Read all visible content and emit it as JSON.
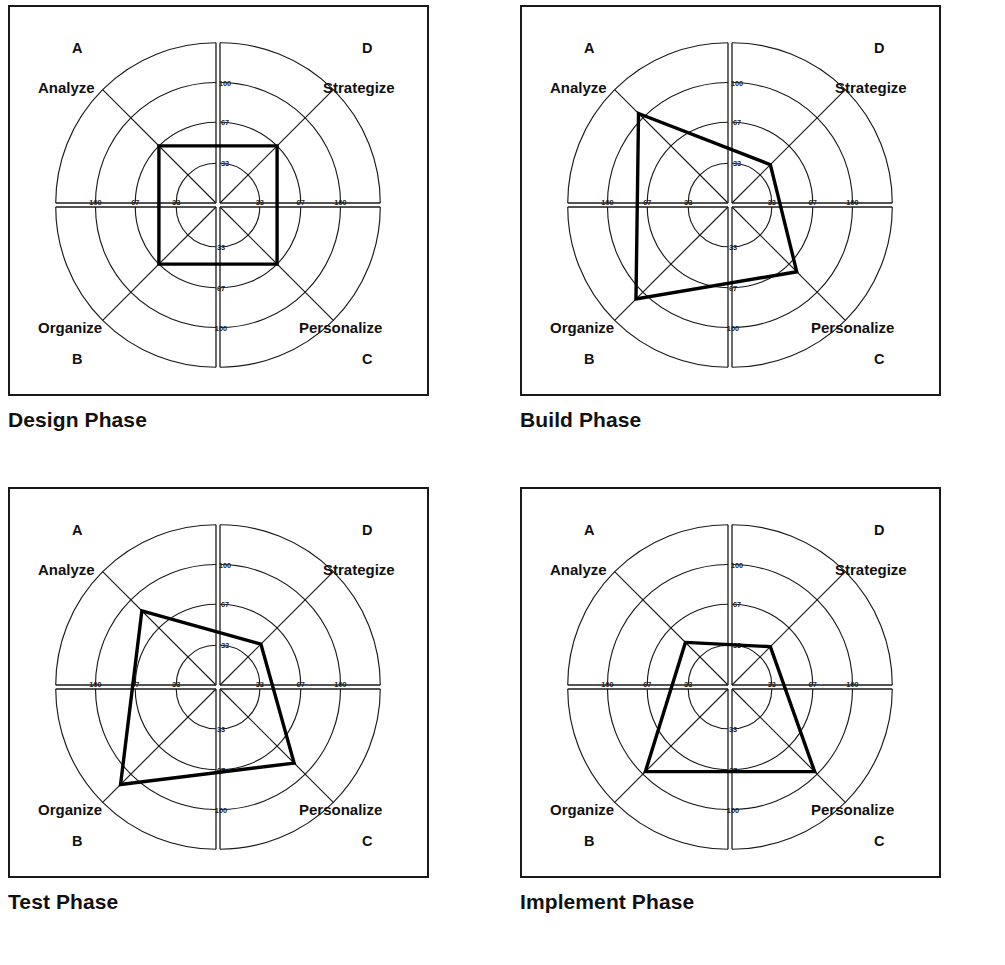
{
  "page": {
    "background_color": "#ffffff",
    "line_color": "#1a1a1a",
    "profile_color": "#000000"
  },
  "quadrants": {
    "A": {
      "letter": "A",
      "label": "Analyze",
      "position": "upper-left"
    },
    "D": {
      "letter": "D",
      "label": "Strategize",
      "position": "upper-right"
    },
    "B": {
      "letter": "B",
      "label": "Organize",
      "position": "lower-left"
    },
    "C": {
      "letter": "C",
      "label": "Personalize",
      "position": "lower-right"
    }
  },
  "scale": {
    "ticks": [
      33,
      67,
      100
    ],
    "tick_labels": [
      "33",
      "67",
      "100"
    ],
    "horizontal_left": [
      "100",
      "67",
      "33"
    ],
    "horizontal_right": [
      "33",
      "67",
      "100"
    ],
    "vertical_top": [
      "100",
      "67",
      "33"
    ],
    "vertical_bottom": [
      "33",
      "67",
      "100"
    ],
    "max": 133,
    "min": 0
  },
  "charts": [
    {
      "id": "design",
      "title": "Design Phase",
      "quadrant_values": {
        "A": 67,
        "D": 67,
        "C": 67,
        "B": 67
      },
      "shape": "square"
    },
    {
      "id": "build",
      "title": "Build Phase",
      "quadrant_values": {
        "A": 105,
        "D": 45,
        "C": 76,
        "B": 108
      },
      "shape": "irregular-quadrilateral"
    },
    {
      "id": "test",
      "title": "Test Phase",
      "quadrant_values": {
        "A": 87,
        "D": 48,
        "C": 87,
        "B": 112
      },
      "shape": "irregular-quadrilateral"
    },
    {
      "id": "implement",
      "title": "Implement Phase",
      "quadrant_values": {
        "A": 50,
        "D": 45,
        "C": 97,
        "B": 97
      },
      "shape": "trapezoid"
    }
  ],
  "chart_data": {
    "type": "radar",
    "axes": [
      "A Analyze",
      "D Strategize",
      "C Personalize",
      "B Organize"
    ],
    "axis_angles_deg": [
      135,
      45,
      315,
      225
    ],
    "rings": [
      33,
      67,
      100
    ],
    "outer_ring": 133,
    "tick_labels": [
      "33",
      "67",
      "100"
    ],
    "grid": true,
    "legend_position": "none",
    "series": [
      {
        "name": "Design Phase",
        "values": [
          67,
          67,
          67,
          67
        ]
      },
      {
        "name": "Build Phase",
        "values": [
          105,
          45,
          76,
          108
        ]
      },
      {
        "name": "Test Phase",
        "values": [
          87,
          48,
          87,
          112
        ]
      },
      {
        "name": "Implement Phase",
        "values": [
          50,
          45,
          97,
          97
        ]
      }
    ],
    "categories": [
      "A Analyze",
      "D Strategize",
      "C Personalize",
      "B Organize"
    ],
    "xlabel": "",
    "ylabel": "",
    "ylim": [
      0,
      133
    ]
  }
}
